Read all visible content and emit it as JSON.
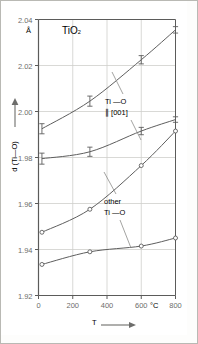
{
  "figure": {
    "title": "TiO",
    "title_sub": "2",
    "y_unit": "Å",
    "x_unit": "°C",
    "y_axis_label": "d (Ti—O)",
    "x_axis_label": "T",
    "arrow_glyph": "⟶"
  },
  "annotations": [
    {
      "id": "ann-parallel-001",
      "line1": "Ti —O",
      "line2": "∥ [001]"
    },
    {
      "id": "ann-other",
      "line1": "other",
      "line2": "Ti —O"
    }
  ],
  "chart_data": {
    "type": "line",
    "title": "TiO2",
    "xlabel": "T",
    "ylabel": "d(Ti—O)",
    "x_unit": "°C",
    "y_unit": "Å",
    "xlim": [
      0,
      800
    ],
    "ylim": [
      1.92,
      2.04
    ],
    "xticks": [
      0,
      200,
      400,
      600,
      800
    ],
    "yticks": [
      1.92,
      1.94,
      1.96,
      1.98,
      2.0,
      2.02,
      2.04
    ],
    "xtick_labels": [
      "0",
      "200",
      "400",
      "600",
      "800"
    ],
    "ytick_labels": [
      "1.92",
      "1.94",
      "1.96",
      "1.98",
      "2.00",
      "2.02",
      "2.04"
    ],
    "grid": true,
    "legend": "none",
    "x": [
      20,
      300,
      600,
      800
    ],
    "series": [
      {
        "name": "Ti—O ∥ [001] (apical, upper)",
        "values": [
          1.9925,
          2.0045,
          2.0225,
          2.0355
        ],
        "errors": [
          0.0022,
          0.0022,
          0.0018,
          0.0014
        ],
        "marker": "error-bar"
      },
      {
        "name": "Ti—O ∥ [001] (lower)",
        "values": [
          1.9795,
          1.9825,
          1.9915,
          1.9965
        ],
        "errors": [
          0.0024,
          0.002,
          0.0016,
          0.0012
        ],
        "marker": "error-bar"
      },
      {
        "name": "other Ti—O (upper)",
        "values": [
          1.9475,
          1.9575,
          1.9765,
          1.9915
        ],
        "errors": [
          0,
          0,
          0,
          0
        ],
        "marker": "open-circle"
      },
      {
        "name": "other Ti—O (lower)",
        "values": [
          1.9335,
          1.939,
          1.9415,
          1.945
        ],
        "errors": [
          0,
          0,
          0,
          0
        ],
        "marker": "open-circle"
      }
    ]
  }
}
